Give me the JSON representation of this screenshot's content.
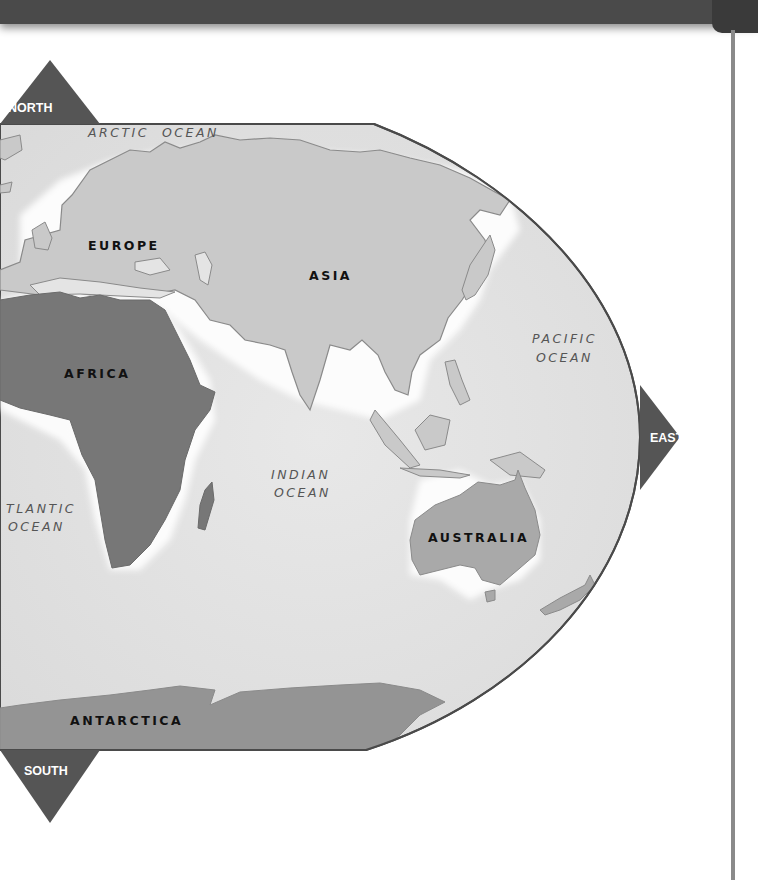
{
  "map": {
    "colors": {
      "ocean": "#e4e4e4",
      "land_light": "#c8c8c8",
      "land_dark": "#777777",
      "coast": "#8a8a8a",
      "border": "#4a4a4a",
      "direction_marker": "#555555",
      "top_bar": "#4a4a4a"
    },
    "continents": [
      {
        "name": "EUROPE"
      },
      {
        "name": "ASIA"
      },
      {
        "name": "AFRICA"
      },
      {
        "name": "AUSTRALIA"
      },
      {
        "name": "ANTARCTICA"
      }
    ],
    "oceans": [
      {
        "line1": "ARCTIC  OCEAN"
      },
      {
        "line1": "PACIFIC",
        "line2": "OCEAN"
      },
      {
        "line1": "INDIAN",
        "line2": "OCEAN"
      },
      {
        "line1": "TLANTIC",
        "line2": "OCEAN"
      }
    ],
    "directions": {
      "north": "NORTH",
      "east": "EAST",
      "south": "SOUTH"
    }
  }
}
